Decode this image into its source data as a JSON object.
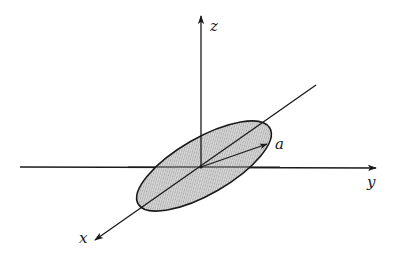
{
  "diagram": {
    "labels": {
      "z": "z",
      "y": "y",
      "x": "x",
      "vector": "a"
    },
    "colors": {
      "stroke": "#1a1a1a",
      "disk_fill": "#cfcfcf",
      "background": "#ffffff"
    },
    "origin": {
      "x": 201,
      "y": 167
    },
    "axes": {
      "z": {
        "from": [
          201,
          167
        ],
        "to": [
          201,
          14
        ]
      },
      "y": {
        "from": [
          20,
          167
        ],
        "to": [
          378,
          168
        ]
      },
      "x": {
        "from": [
          316,
          85
        ],
        "to": [
          93,
          241
        ]
      }
    },
    "disk": {
      "center": [
        204,
        166
      ],
      "semi_major": 76,
      "semi_minor": 28,
      "rotation_deg": -30
    },
    "vector_a": {
      "from": [
        201,
        167
      ],
      "to": [
        268,
        144
      ]
    }
  }
}
